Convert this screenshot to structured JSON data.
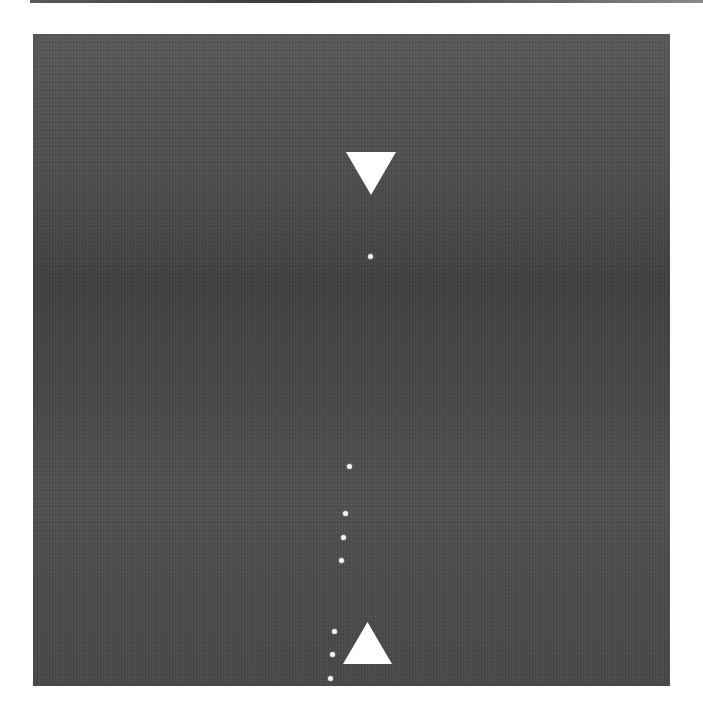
{
  "figure": {
    "background_color": "#ffffff",
    "panel_color": "#4a4a4a",
    "marker_color": "#ffffff",
    "markers": [
      {
        "type": "triangle-down",
        "x": 346,
        "y": 152,
        "width": 50,
        "height": 43
      },
      {
        "type": "triangle-up",
        "x": 343,
        "y": 622,
        "width": 49,
        "height": 42
      }
    ],
    "dots": [
      {
        "x": 370,
        "y": 256
      },
      {
        "x": 349,
        "y": 466
      },
      {
        "x": 345,
        "y": 513
      },
      {
        "x": 343,
        "y": 537
      },
      {
        "x": 341,
        "y": 560
      },
      {
        "x": 334,
        "y": 631
      },
      {
        "x": 332,
        "y": 654
      },
      {
        "x": 330,
        "y": 678
      }
    ]
  }
}
